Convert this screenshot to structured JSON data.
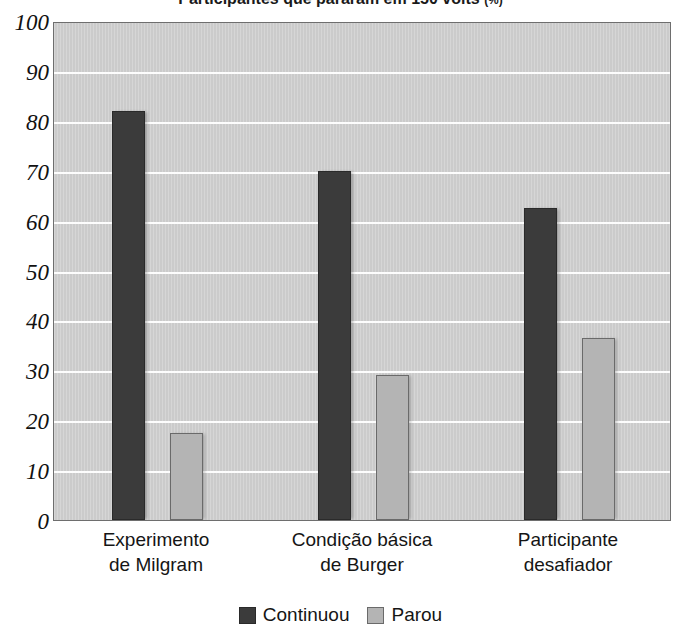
{
  "chart_data": {
    "type": "bar",
    "title": "Participantes que pararam em 150 volts (%)",
    "title_main": "Participantes que pararam em 150 volts",
    "title_unit": "(%)",
    "xlabel": "",
    "ylabel": "",
    "ylim": [
      0,
      100
    ],
    "ytick_step": 10,
    "yticks": [
      0,
      10,
      20,
      30,
      40,
      50,
      60,
      70,
      80,
      90,
      100
    ],
    "ytick_labels": [
      "0",
      "10",
      "20",
      "30",
      "40",
      "50",
      "60",
      "70",
      "80",
      "90",
      "100"
    ],
    "grid": true,
    "grid_axis": "y",
    "legend_position": "bottom-center",
    "categories": [
      "Experimento de Milgram",
      "Condição básica de Burger",
      "Participante desafiador"
    ],
    "category_lines": [
      [
        "Experimento",
        "de Milgram"
      ],
      [
        "Condição básica",
        "de Burger"
      ],
      [
        "Participante",
        "desafiador"
      ]
    ],
    "series": [
      {
        "name": "Continuou",
        "color": "#3b3b3b",
        "values": [
          82,
          70,
          62.5
        ]
      },
      {
        "name": "Parou",
        "color": "#b4b4b4",
        "values": [
          17.5,
          29,
          36.5
        ]
      }
    ],
    "colors": {
      "plot_background": "#cbcbcb",
      "gridline": "#fdfdfd",
      "axis_border": "#6e6e6e",
      "text": "#151515",
      "series_continuou": "#3b3b3b",
      "series_parou": "#b4b4b4"
    }
  },
  "legend": {
    "items": [
      {
        "label": "Continuou",
        "series": "continuou"
      },
      {
        "label": "Parou",
        "series": "parou"
      }
    ]
  }
}
